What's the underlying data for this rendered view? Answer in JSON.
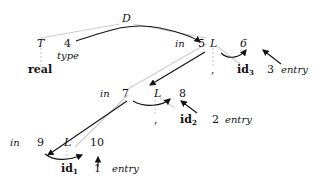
{
  "diagram": {
    "root": {
      "symbol": "D"
    },
    "type_node": {
      "symbol": "T",
      "number": "4",
      "attr": "type",
      "child": "real"
    },
    "level1": {
      "attr": "in",
      "number": "5",
      "symbol": "L",
      "synth_number": "6",
      "comma": ",",
      "id_base": "id",
      "id_sub": "3",
      "entry_number": "3",
      "entry_attr": "entry"
    },
    "level2": {
      "attr": "in",
      "number": "7",
      "symbol": "L",
      "synth_number": "8",
      "comma": ",",
      "id_base": "id",
      "id_sub": "2",
      "entry_number": "2",
      "entry_attr": "entry"
    },
    "level3": {
      "attr": "in",
      "number": "9",
      "symbol": "L",
      "synth_number": "10",
      "id_base": "id",
      "id_sub": "1",
      "entry_number": "1",
      "entry_attr": "entry"
    },
    "colors": {
      "tree_edge": "#cccccc",
      "dependency_edge": "#111111"
    }
  }
}
